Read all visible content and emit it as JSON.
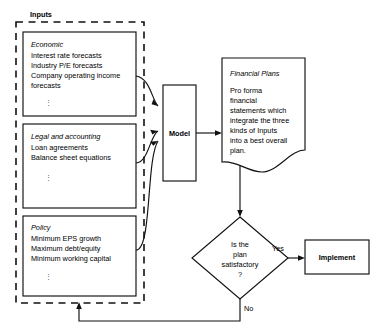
{
  "diagram": {
    "title_label": "Inputs",
    "input_boxes": [
      {
        "heading": "Economic",
        "lines": [
          "Interest rate forecasts",
          "Industry P/E forecasts",
          "Company operating income",
          "forecasts"
        ],
        "ellipsis": "⋮"
      },
      {
        "heading": "Legal and accounting",
        "lines": [
          "Loan agreements",
          "Balance sheet equations"
        ],
        "ellipsis": "⋮"
      },
      {
        "heading": "Policy",
        "lines": [
          "Minimum EPS growth",
          "Maximum debt/equity",
          "Minimum working capital"
        ],
        "ellipsis": "⋮"
      }
    ],
    "model_box": {
      "label": "Model"
    },
    "financial_plans": {
      "heading": "Financial Plans",
      "lines": [
        "Pro forma",
        "financial",
        "statements which",
        "integrate the three",
        "kinds of Inputs",
        "into a best overall",
        "plan."
      ]
    },
    "decision": {
      "lines": [
        "Is the",
        "plan",
        "satisfactory",
        "?"
      ]
    },
    "implement_box": {
      "label": "Implement"
    },
    "edge_labels": {
      "yes": "Yes",
      "no": "No"
    },
    "colors": {
      "stroke": "#111111",
      "background": "#ffffff",
      "text": "#000000"
    }
  }
}
